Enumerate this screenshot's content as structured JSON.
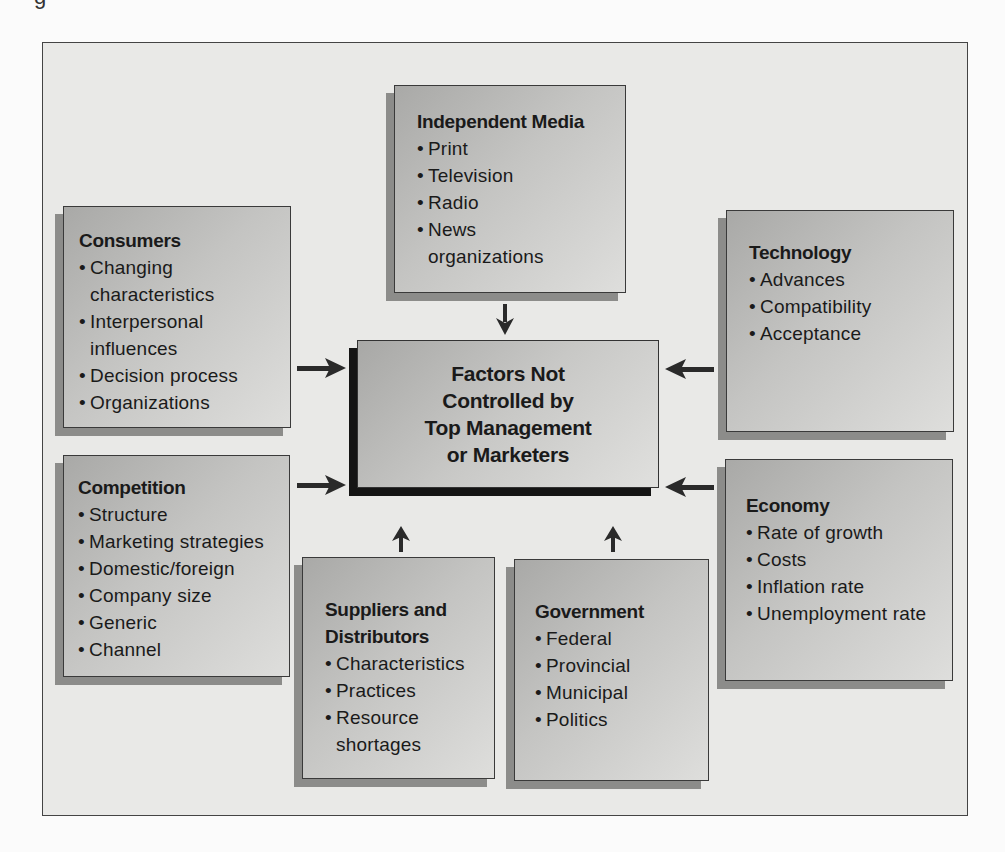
{
  "page_fragment": "g",
  "diagram": {
    "center": {
      "lines": [
        "Factors Not",
        "Controlled by",
        "Top Management",
        "or Marketers"
      ]
    },
    "boxes": {
      "independent_media": {
        "title": "Independent Media",
        "items": [
          "Print",
          "Television",
          "Radio",
          "News organizations"
        ]
      },
      "consumers": {
        "title": "Consumers",
        "items": [
          "Changing characteristics",
          "Interpersonal influences",
          "Decision process",
          "Organizations"
        ]
      },
      "technology": {
        "title": "Technology",
        "items": [
          "Advances",
          "Compatibility",
          "Acceptance"
        ]
      },
      "competition": {
        "title": "Competition",
        "items": [
          "Structure",
          "Marketing strategies",
          "Domestic/foreign",
          "Company size",
          "Generic",
          "Channel"
        ]
      },
      "economy": {
        "title": "Economy",
        "items": [
          "Rate of growth",
          "Costs",
          "Inflation rate",
          "Unemployment rate"
        ]
      },
      "suppliers": {
        "title_lines": [
          "Suppliers and",
          "Distributors"
        ],
        "items": [
          "Characteristics",
          "Practices",
          "Resource shortages"
        ]
      },
      "government": {
        "title": "Government",
        "items": [
          "Federal",
          "Provincial",
          "Municipal",
          "Politics"
        ]
      }
    },
    "arrows": [
      {
        "from": "independent_media",
        "to": "center",
        "direction": "down"
      },
      {
        "from": "consumers",
        "to": "center",
        "direction": "right"
      },
      {
        "from": "competition",
        "to": "center",
        "direction": "right"
      },
      {
        "from": "technology",
        "to": "center",
        "direction": "left"
      },
      {
        "from": "economy",
        "to": "center",
        "direction": "left"
      },
      {
        "from": "suppliers",
        "to": "center",
        "direction": "up"
      },
      {
        "from": "government",
        "to": "center",
        "direction": "up"
      }
    ],
    "colors": {
      "frame_bg": "#e9e9e7",
      "box_fill_dark": "#a9a9a7",
      "box_fill_light": "#dededc",
      "box_shadow": "#8c8c8a",
      "center_shadow": "#141414",
      "arrow": "#2a2a2a"
    }
  }
}
